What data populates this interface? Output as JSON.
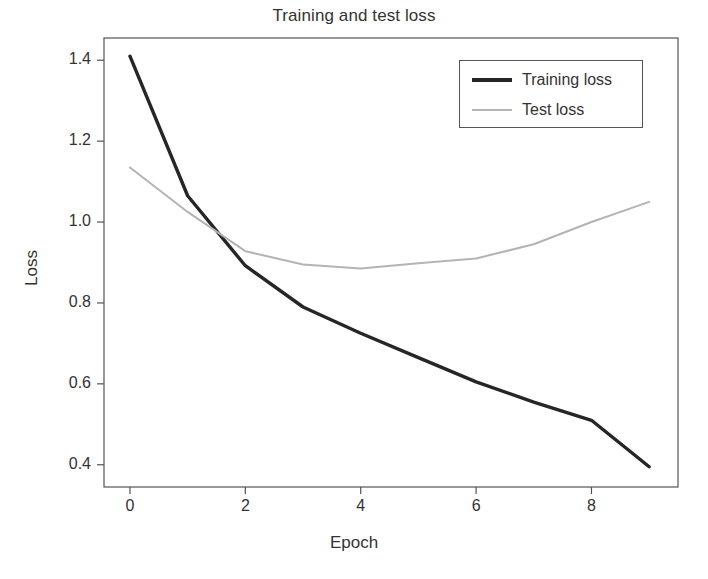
{
  "chart_data": {
    "type": "line",
    "title": "Training and test loss",
    "xlabel": "Epoch",
    "ylabel": "Loss",
    "x": [
      0,
      1,
      2,
      3,
      4,
      5,
      6,
      7,
      8,
      9
    ],
    "xlim": [
      -0.45,
      9.5
    ],
    "ylim": [
      0.345,
      1.455
    ],
    "xticks": [
      0,
      2,
      4,
      6,
      8
    ],
    "xtick_labels": [
      "0",
      "2",
      "4",
      "6",
      "8"
    ],
    "yticks": [
      0.4,
      0.6,
      0.8,
      1.0,
      1.2,
      1.4
    ],
    "ytick_labels": [
      "0.4",
      "0.6",
      "0.8",
      "1.0",
      "1.2",
      "1.4"
    ],
    "grid": false,
    "legend_position": "upper right",
    "series": [
      {
        "name": "Training loss",
        "values": [
          1.41,
          1.065,
          0.892,
          0.79,
          0.725,
          0.665,
          0.605,
          0.555,
          0.51,
          0.395
        ],
        "color": "#262626",
        "line_width": 3.4
      },
      {
        "name": "Test loss",
        "values": [
          1.135,
          1.025,
          0.928,
          0.895,
          0.885,
          0.898,
          0.91,
          0.945,
          1.0,
          1.05
        ],
        "color": "#b4b4b4",
        "line_width": 2.0
      }
    ]
  },
  "axes": {
    "frame_color": "#545454",
    "background": "#ffffff"
  }
}
